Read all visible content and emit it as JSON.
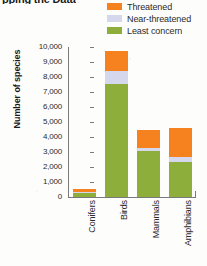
{
  "title": "pping the Data",
  "legend": {
    "position": "top-right",
    "items": [
      {
        "label": "Threatened",
        "color": "#F5821F"
      },
      {
        "label": "Near-threatened",
        "color": "#D5D8EC"
      },
      {
        "label": "Least concern",
        "color": "#8DAE3A"
      }
    ]
  },
  "axes": {
    "ylabel": "Number of species",
    "xlabel": "",
    "yticks": [
      "10,000",
      "9,000",
      "8,000",
      "7,000",
      "6,000",
      "5,000",
      "4,000",
      "3,000",
      "2,000",
      "1,000",
      "0"
    ]
  },
  "chart_data": {
    "type": "bar",
    "subtype": "stacked",
    "title": "pping the Data",
    "xlabel": "",
    "ylabel": "Number of species",
    "ylim": [
      0,
      10000
    ],
    "ytick_step": 1000,
    "grid": false,
    "legend_position": "top-right",
    "categories": [
      "Conifers",
      "Birds",
      "Mammals",
      "Amphibians"
    ],
    "series": [
      {
        "name": "Least concern",
        "color": "#8DAE3A",
        "values": [
          300,
          7550,
          3050,
          2350
        ]
      },
      {
        "name": "Near-threatened",
        "color": "#D5D8EC",
        "values": [
          50,
          850,
          200,
          350
        ]
      },
      {
        "name": "Threatened",
        "color": "#F5821F",
        "values": [
          200,
          1350,
          1250,
          1900
        ]
      }
    ],
    "totals": [
      550,
      9750,
      4500,
      4600
    ],
    "stack_order_bottom_to_top": [
      "Least concern",
      "Near-threatened",
      "Threatened"
    ]
  }
}
